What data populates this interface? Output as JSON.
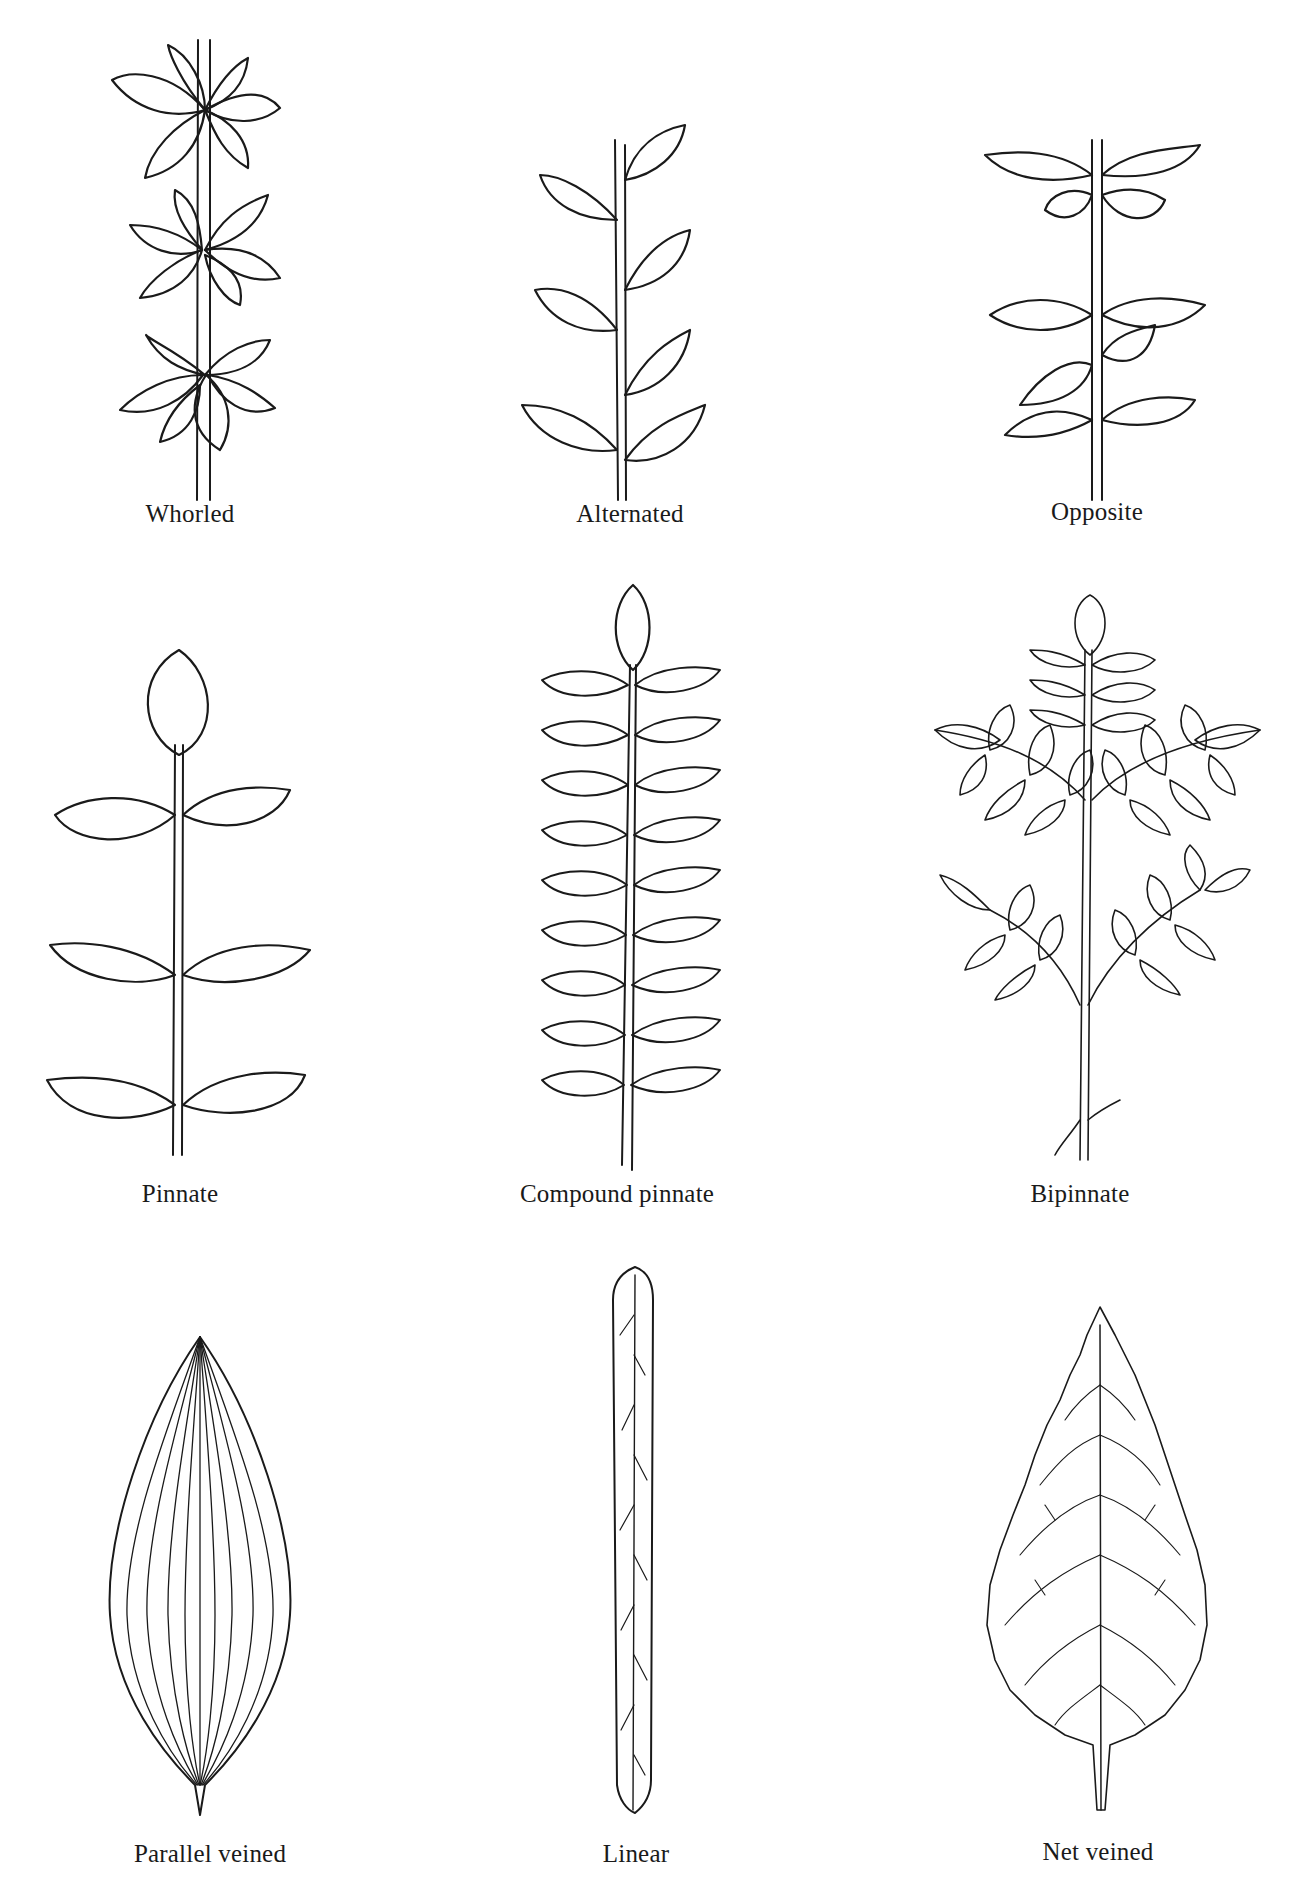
{
  "figure": {
    "background": "#ffffff",
    "ink_color": "#1a1a1a",
    "rows": [
      {
        "row": "arrangement",
        "items": [
          {
            "id": "whorled",
            "label": "Whorled"
          },
          {
            "id": "alternated",
            "label": "Alternated"
          },
          {
            "id": "opposite",
            "label": "Opposite"
          }
        ]
      },
      {
        "row": "compound",
        "items": [
          {
            "id": "pinnate",
            "label": "Pinnate"
          },
          {
            "id": "compound-pinnate",
            "label": "Compound pinnate"
          },
          {
            "id": "bipinnate",
            "label": "Bipinnate"
          }
        ]
      },
      {
        "row": "venation-shape",
        "items": [
          {
            "id": "parallel-veined",
            "label": "Parallel veined"
          },
          {
            "id": "linear",
            "label": "Linear"
          },
          {
            "id": "net-veined",
            "label": "Net veined"
          }
        ]
      }
    ]
  }
}
